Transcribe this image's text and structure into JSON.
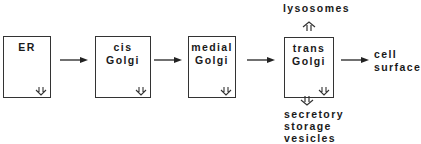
{
  "diagram": {
    "title": "",
    "nodes": [
      {
        "id": "er",
        "lines": [
          "ER"
        ]
      },
      {
        "id": "cis",
        "lines": [
          "cis",
          "Golgi"
        ]
      },
      {
        "id": "medial",
        "lines": [
          "medial",
          "Golgi"
        ]
      },
      {
        "id": "trans",
        "lines": [
          "trans",
          "Golgi"
        ]
      }
    ],
    "outputs": {
      "cell_surface": [
        "cell",
        "surface"
      ],
      "lysosomes": "lysosomes",
      "secretory": [
        "secretory",
        "storage",
        "vesicles"
      ]
    },
    "edges": [
      {
        "from": "ER",
        "to": "cis Golgi"
      },
      {
        "from": "cis Golgi",
        "to": "medial Golgi"
      },
      {
        "from": "medial Golgi",
        "to": "trans Golgi"
      },
      {
        "from": "trans Golgi",
        "to": "cell surface"
      },
      {
        "from": "trans Golgi",
        "to": "lysosomes"
      },
      {
        "from": "trans Golgi",
        "to": "secretory storage vesicles"
      }
    ],
    "colors": {
      "line": "#333333",
      "text": "#1a1a1a",
      "background": "#ffffff"
    }
  }
}
